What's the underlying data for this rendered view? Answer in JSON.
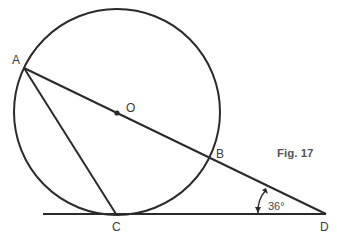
{
  "figure": {
    "caption": "Fig. 17",
    "points": {
      "A": "A",
      "O": "O",
      "B": "B",
      "C": "C",
      "D": "D"
    },
    "angle_label": "36°",
    "colors": {
      "line": "#2a2a2a",
      "text": "#3a3a3a",
      "background": "#ffffff"
    }
  }
}
